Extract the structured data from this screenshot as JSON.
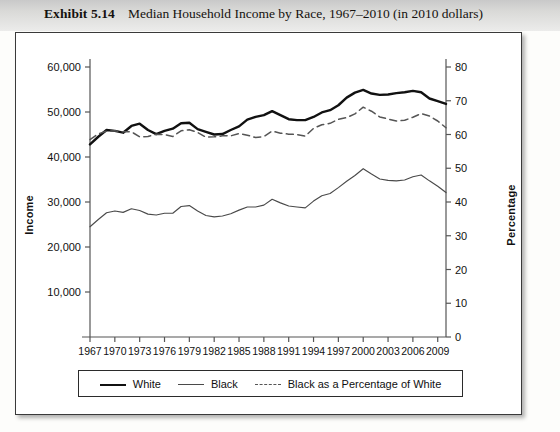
{
  "header": {
    "exhibit_number": "Exhibit 5.14",
    "exhibit_title": "Median Household Income by Race, 1967–2010 (in 2010 dollars)"
  },
  "chart_data": {
    "type": "line",
    "title": "Median Household Income by Race, 1967–2010 (in 2010 dollars)",
    "xlabel": "",
    "ylabel": "Income",
    "y2label": "Percentage",
    "xlim": [
      1967,
      2010
    ],
    "ylim": [
      0,
      60000
    ],
    "y2lim": [
      0,
      80
    ],
    "grid": false,
    "legend_position": "bottom",
    "xticks": [
      1967,
      1970,
      1973,
      1976,
      1979,
      1982,
      1985,
      1988,
      1991,
      1994,
      1997,
      2000,
      2003,
      2006,
      2009
    ],
    "xticklabels": [
      "1967",
      "1970",
      "1973",
      "1976",
      "1979",
      "1982",
      "1985",
      "1988",
      "1991",
      "1994",
      "1997",
      "2000",
      "2003",
      "2006",
      "2009"
    ],
    "yticks": [
      10000,
      20000,
      30000,
      40000,
      50000,
      60000
    ],
    "yticklabels": [
      "10,000",
      "20,000",
      "30,000",
      "40,000",
      "50,000",
      "60,000"
    ],
    "y2ticks": [
      0,
      10,
      20,
      30,
      40,
      50,
      60,
      70,
      80
    ],
    "y2ticklabels": [
      "0",
      "10",
      "20",
      "30",
      "40",
      "50",
      "60",
      "70",
      "80"
    ],
    "x": [
      1967,
      1968,
      1969,
      1970,
      1971,
      1972,
      1973,
      1974,
      1975,
      1976,
      1977,
      1978,
      1979,
      1980,
      1981,
      1982,
      1983,
      1984,
      1985,
      1986,
      1987,
      1988,
      1989,
      1990,
      1991,
      1992,
      1993,
      1994,
      1995,
      1996,
      1997,
      1998,
      1999,
      2000,
      2001,
      2002,
      2003,
      2004,
      2005,
      2006,
      2007,
      2008,
      2009,
      2010
    ],
    "series": [
      {
        "name": "White",
        "axis": "left",
        "style": "solid-thick",
        "color": "#111111",
        "values": [
          42800,
          44500,
          46000,
          45800,
          45400,
          46900,
          47400,
          46000,
          45100,
          45800,
          46300,
          47500,
          47600,
          46200,
          45600,
          45000,
          45100,
          46000,
          46800,
          48300,
          48900,
          49300,
          50200,
          49300,
          48400,
          48200,
          48200,
          48900,
          49900,
          50400,
          51500,
          53200,
          54300,
          54900,
          54100,
          53800,
          53900,
          54200,
          54400,
          54700,
          54400,
          53000,
          52400,
          51800
        ]
      },
      {
        "name": "Black",
        "axis": "left",
        "style": "solid-thin",
        "color": "#4a4a4a",
        "values": [
          24500,
          26100,
          27600,
          28000,
          27700,
          28500,
          28100,
          27300,
          27100,
          27500,
          27500,
          29000,
          29200,
          28000,
          27000,
          26700,
          26900,
          27400,
          28200,
          28900,
          28900,
          29300,
          30600,
          29800,
          29100,
          28900,
          28700,
          30200,
          31400,
          31900,
          33200,
          34600,
          35900,
          37400,
          36200,
          35100,
          34800,
          34700,
          34900,
          35600,
          36000,
          34700,
          33500,
          32100
        ]
      },
      {
        "name": "Black as a Percentage of White",
        "axis": "right",
        "style": "dashed",
        "color": "#555555",
        "values": [
          58.5,
          60.2,
          61.0,
          61.1,
          60.8,
          60.8,
          59.3,
          59.4,
          60.1,
          60.0,
          59.4,
          61.1,
          61.4,
          60.6,
          59.2,
          59.3,
          59.6,
          59.6,
          60.3,
          59.8,
          59.1,
          59.4,
          61.0,
          60.4,
          60.1,
          60.0,
          59.5,
          61.8,
          62.9,
          63.3,
          64.5,
          65.0,
          66.1,
          68.1,
          66.9,
          65.2,
          64.6,
          64.0,
          64.2,
          65.1,
          66.2,
          65.5,
          64.0,
          62.0
        ]
      }
    ]
  },
  "legend": {
    "items": [
      {
        "label": "White",
        "swatch": "thick-solid-line"
      },
      {
        "label": "Black",
        "swatch": "thin-solid-line"
      },
      {
        "label": "Black as a Percentage of White",
        "swatch": "dashed-line"
      }
    ]
  },
  "colors": {
    "white_series": "#111111",
    "black_series": "#4a4a4a",
    "ratio_series": "#555555",
    "axis": "#555555",
    "frame": "#3a3a3a",
    "header_band": "#d9d9d7"
  }
}
